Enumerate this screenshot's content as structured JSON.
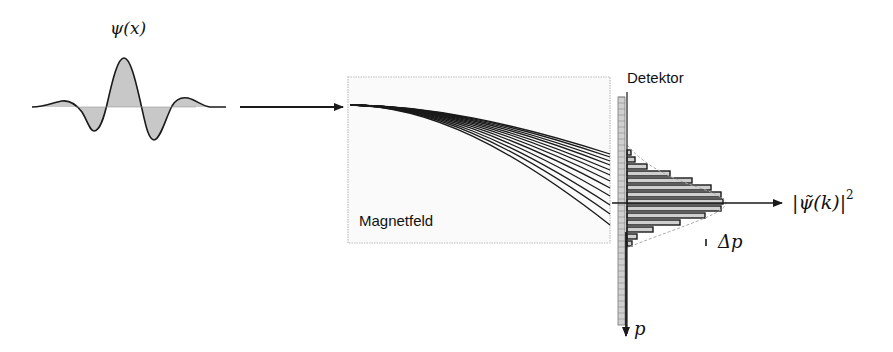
{
  "labels": {
    "wavefunction": "ψ(x)",
    "field": "Magnetfeld",
    "detector": "Detektor",
    "momentum_axis": "p",
    "distribution": "|ψ̃(k)|",
    "distribution_power": "2",
    "spread": "Δp"
  },
  "colors": {
    "stroke": "#1a1a1a",
    "fill_gray": "#c8c8c8",
    "box_border": "#bdbdbd",
    "detector_fill": "#d0d0d0",
    "bar_fill": "#cfcfcf"
  },
  "wave_packet": {
    "baseline_y": 107,
    "x_start": 32,
    "x_end": 226
  },
  "trajectories": {
    "count": 12,
    "start": [
      350,
      105
    ],
    "end_x": 610,
    "end_y": [
      154,
      157,
      161,
      165,
      170,
      175,
      181,
      188,
      196,
      205,
      214,
      225
    ]
  },
  "histogram": {
    "axis_x": 627,
    "center_y": 203,
    "bar_height": 7,
    "bars": [
      {
        "y": 150,
        "len": 4
      },
      {
        "y": 157,
        "len": 8
      },
      {
        "y": 164,
        "len": 20
      },
      {
        "y": 171,
        "len": 43
      },
      {
        "y": 178,
        "len": 65
      },
      {
        "y": 185,
        "len": 84
      },
      {
        "y": 192,
        "len": 94
      },
      {
        "y": 199,
        "len": 96
      },
      {
        "y": 206,
        "len": 94
      },
      {
        "y": 213,
        "len": 78
      },
      {
        "y": 220,
        "len": 53
      },
      {
        "y": 227,
        "len": 26
      },
      {
        "y": 234,
        "len": 10
      },
      {
        "y": 241,
        "len": 5
      }
    ]
  }
}
